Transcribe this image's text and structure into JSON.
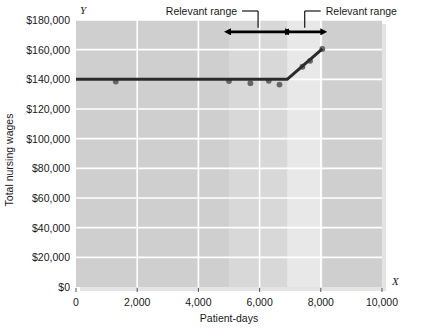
{
  "chart_data": {
    "type": "line",
    "title": "",
    "xlabel": "Patient-days",
    "ylabel": "Total nursing wages",
    "x_axis_letter": "X",
    "y_axis_letter": "Y",
    "xlim": [
      0,
      10000
    ],
    "ylim": [
      0,
      180000
    ],
    "grid": true,
    "legend": "none",
    "x_ticks": [
      0,
      2000,
      4000,
      6000,
      8000,
      10000
    ],
    "x_tick_labels": [
      "0",
      "2,000",
      "4,000",
      "6,000",
      "8,000",
      "10,000"
    ],
    "y_ticks": [
      0,
      20000,
      40000,
      60000,
      80000,
      100000,
      120000,
      140000,
      160000,
      180000
    ],
    "y_tick_labels": [
      "$0",
      "$20,000",
      "$40,000",
      "$60,000",
      "$80,000",
      "$100,000",
      "$120,000",
      "$140,000",
      "$160,000",
      "$180,000"
    ],
    "series": [
      {
        "name": "Total nursing wages cost line",
        "type": "line",
        "color": "#2b2b2b",
        "points": [
          {
            "x": 0,
            "y": 140000
          },
          {
            "x": 6900,
            "y": 140000
          },
          {
            "x": 8050,
            "y": 160500
          }
        ]
      },
      {
        "name": "Observed cost data points",
        "type": "scatter",
        "color": "#666666",
        "points": [
          {
            "x": 1300,
            "y": 138500
          },
          {
            "x": 5000,
            "y": 138800
          },
          {
            "x": 5700,
            "y": 137400
          },
          {
            "x": 6300,
            "y": 139000
          },
          {
            "x": 6650,
            "y": 136500
          },
          {
            "x": 7400,
            "y": 148500
          },
          {
            "x": 7650,
            "y": 152500
          },
          {
            "x": 8050,
            "y": 160500
          }
        ]
      }
    ],
    "shaded_bands": [
      {
        "name": "relevant-range-band-1",
        "x_start": 5000,
        "x_end": 6900,
        "color": "#d8d8d8"
      },
      {
        "name": "relevant-range-band-2",
        "x_start": 6900,
        "x_end": 8050,
        "color": "#e8e8e8"
      }
    ],
    "plot_background": "#cfcfcf",
    "gridline_color": "#ffffff",
    "annotations": [
      {
        "name": "relevant-range-left",
        "label": "Relevant range",
        "arrow_x_start": 5000,
        "arrow_x_end": 6900,
        "arrow_y": 172000
      },
      {
        "name": "relevant-range-right",
        "label": "Relevant range",
        "arrow_x_start": 6900,
        "arrow_x_end": 8050,
        "arrow_y": 172000
      }
    ]
  }
}
